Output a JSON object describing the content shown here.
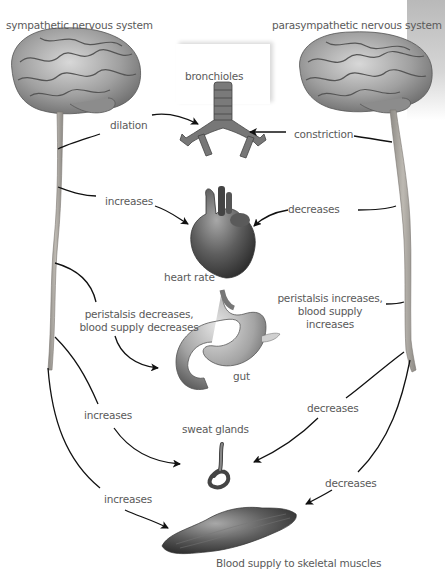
{
  "diagram": {
    "title_left": "sympathetic nervous system",
    "title_right": "parasympathetic nervous system",
    "organs": {
      "bronchioles": "bronchioles",
      "heart": "heart rate",
      "gut": "gut",
      "sweat": "sweat glands",
      "muscle": "Blood supply to skeletal muscles"
    },
    "sympathetic_effects": {
      "bronchioles": "dilation",
      "heart": "increases",
      "gut_line1": "peristalsis decreases,",
      "gut_line2": "blood supply decreases",
      "sweat": "increases",
      "muscle": "increases"
    },
    "parasympathetic_effects": {
      "bronchioles": "constriction",
      "heart": "decreases",
      "gut_line1": "peristalsis increases,",
      "gut_line2": "blood supply",
      "gut_line3": "increases",
      "sweat": "decreases",
      "muscle": "decreases"
    },
    "colors": {
      "text": "#5a5a5a",
      "arrow": "#111111",
      "brain": "#9a9a9a",
      "spinal_cord": "#a6a29c",
      "organ": "#6a6a6a"
    }
  }
}
